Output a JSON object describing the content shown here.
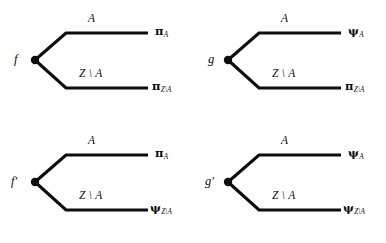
{
  "figure": {
    "type": "diagram",
    "geometry": {
      "vertex": {
        "x": 35,
        "y": 60
      },
      "upper_bend": {
        "x": 66,
        "y": 33
      },
      "upper_end": {
        "x": 148,
        "y": 33
      },
      "lower_bend": {
        "x": 66,
        "y": 88
      },
      "lower_end": {
        "x": 148,
        "y": 88
      },
      "line_width": 3.1,
      "dot_radius": 4.2,
      "color": "#0d0d0d"
    }
  },
  "diagrams": [
    {
      "id": "top-left",
      "source": "f",
      "prime": "",
      "upper": {
        "branch": "A",
        "endpoint_symbol": "π",
        "endpoint_sub": "A"
      },
      "lower": {
        "branch": "Z \\ A",
        "endpoint_symbol": "π",
        "endpoint_sub": "Z\\A"
      }
    },
    {
      "id": "top-right",
      "source": "g",
      "prime": "",
      "upper": {
        "branch": "A",
        "endpoint_symbol": "ψ",
        "endpoint_sub": "A"
      },
      "lower": {
        "branch": "Z \\ A",
        "endpoint_symbol": "π",
        "endpoint_sub": "Z\\A"
      }
    },
    {
      "id": "bottom-left",
      "source": "f",
      "prime": "′",
      "upper": {
        "branch": "A",
        "endpoint_symbol": "π",
        "endpoint_sub": "A"
      },
      "lower": {
        "branch": "Z \\ A",
        "endpoint_symbol": "ψ",
        "endpoint_sub": "Z\\A"
      }
    },
    {
      "id": "bottom-right",
      "source": "g",
      "prime": "′",
      "upper": {
        "branch": "A",
        "endpoint_symbol": "ψ",
        "endpoint_sub": "A"
      },
      "lower": {
        "branch": "Z \\ A",
        "endpoint_symbol": "ψ",
        "endpoint_sub": "Z\\A"
      }
    }
  ]
}
